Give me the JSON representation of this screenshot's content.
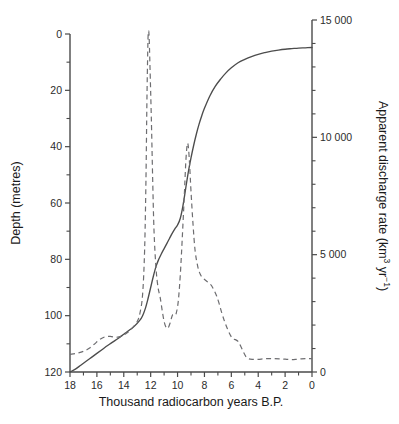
{
  "figure": {
    "name": "sea-level-and-meltwater-discharge-chart",
    "background": "#ffffff"
  },
  "chart_data": {
    "type": "line",
    "title": "",
    "subtitle": "",
    "xlabel": "Thousand radiocarbon years B.P.",
    "x_axis": {
      "min": 18,
      "max": 0,
      "reversed": true,
      "ticks": [
        18,
        16,
        14,
        12,
        10,
        8,
        6,
        4,
        2,
        0
      ],
      "tick_labels": [
        "18",
        "16",
        "14",
        "12",
        "10",
        "8",
        "6",
        "4",
        "2",
        "0"
      ],
      "minor_tick_step": 1
    },
    "y_axis_left": {
      "label": "Depth (metres)",
      "min": 0,
      "max": 120,
      "inverted": true,
      "ticks": [
        0,
        20,
        40,
        60,
        80,
        100,
        120
      ],
      "tick_labels": [
        "0",
        "20",
        "40",
        "60",
        "80",
        "100",
        "120"
      ],
      "minor_ticks": [
        10,
        30,
        50,
        70,
        90,
        110
      ]
    },
    "y_axis_right": {
      "label": "Apparent discharge rate (km3 yr-1)",
      "label_parts": {
        "main": "Apparent discharge rate (km",
        "sup1": "3",
        "mid": " yr",
        "sup2": "−1",
        "tail": ")"
      },
      "min": 0,
      "max": 15000,
      "ticks": [
        0,
        5000,
        10000,
        15000
      ],
      "tick_labels": [
        "0",
        "5 000",
        "10 000",
        "15 000"
      ]
    },
    "grid": false,
    "legend": null,
    "series": [
      {
        "name": "Depth (sea-level rise curve)",
        "style": "solid",
        "color": "#4c4c4c",
        "axis": "left",
        "units": "metres below present",
        "points": [
          [
            18.0,
            120.0
          ],
          [
            17.6,
            119.0
          ],
          [
            17.2,
            117.6
          ],
          [
            16.8,
            116.2
          ],
          [
            16.4,
            114.8
          ],
          [
            16.0,
            113.4
          ],
          [
            15.6,
            112.0
          ],
          [
            15.2,
            110.6
          ],
          [
            14.8,
            109.3
          ],
          [
            14.4,
            108.0
          ],
          [
            14.0,
            106.6
          ],
          [
            13.6,
            105.2
          ],
          [
            13.2,
            103.7
          ],
          [
            12.8,
            101.6
          ],
          [
            12.6,
            100.0
          ],
          [
            12.4,
            97.5
          ],
          [
            12.2,
            94.0
          ],
          [
            12.0,
            90.0
          ],
          [
            11.8,
            86.0
          ],
          [
            11.6,
            82.5
          ],
          [
            11.4,
            80.0
          ],
          [
            11.2,
            78.0
          ],
          [
            11.0,
            76.2
          ],
          [
            10.8,
            74.4
          ],
          [
            10.6,
            72.6
          ],
          [
            10.4,
            70.8
          ],
          [
            10.2,
            69.2
          ],
          [
            10.0,
            67.8
          ],
          [
            9.8,
            65.5
          ],
          [
            9.6,
            61.0
          ],
          [
            9.4,
            55.0
          ],
          [
            9.2,
            49.0
          ],
          [
            9.0,
            44.0
          ],
          [
            8.8,
            39.5
          ],
          [
            8.6,
            35.5
          ],
          [
            8.4,
            32.0
          ],
          [
            8.2,
            29.0
          ],
          [
            8.0,
            26.4
          ],
          [
            7.6,
            22.0
          ],
          [
            7.2,
            18.6
          ],
          [
            6.8,
            16.0
          ],
          [
            6.4,
            13.8
          ],
          [
            6.0,
            12.0
          ],
          [
            5.5,
            10.2
          ],
          [
            5.0,
            9.0
          ],
          [
            4.5,
            8.0
          ],
          [
            4.0,
            7.2
          ],
          [
            3.5,
            6.6
          ],
          [
            3.0,
            6.1
          ],
          [
            2.5,
            5.7
          ],
          [
            2.0,
            5.4
          ],
          [
            1.5,
            5.2
          ],
          [
            1.0,
            5.0
          ],
          [
            0.5,
            4.9
          ],
          [
            0.0,
            4.8
          ]
        ]
      },
      {
        "name": "Apparent discharge rate",
        "style": "dashed",
        "color": "#6d6d70",
        "axis": "right",
        "units": "km3 yr-1",
        "points": [
          [
            18.0,
            750
          ],
          [
            17.5,
            800
          ],
          [
            17.0,
            880
          ],
          [
            16.6,
            1000
          ],
          [
            16.2,
            1180
          ],
          [
            15.8,
            1380
          ],
          [
            15.4,
            1500
          ],
          [
            15.0,
            1520
          ],
          [
            14.6,
            1480
          ],
          [
            14.2,
            1520
          ],
          [
            13.8,
            1650
          ],
          [
            13.4,
            1850
          ],
          [
            13.0,
            2150
          ],
          [
            12.8,
            2500
          ],
          [
            12.6,
            3300
          ],
          [
            12.45,
            5200
          ],
          [
            12.35,
            8200
          ],
          [
            12.28,
            11500
          ],
          [
            12.22,
            13600
          ],
          [
            12.18,
            14450
          ],
          [
            12.12,
            14350
          ],
          [
            12.05,
            13000
          ],
          [
            11.95,
            10800
          ],
          [
            11.85,
            8200
          ],
          [
            11.75,
            6000
          ],
          [
            11.6,
            4400
          ],
          [
            11.45,
            3600
          ],
          [
            11.3,
            3200
          ],
          [
            11.15,
            2650
          ],
          [
            11.0,
            2150
          ],
          [
            10.85,
            1900
          ],
          [
            10.7,
            1880
          ],
          [
            10.55,
            2100
          ],
          [
            10.4,
            2400
          ],
          [
            10.3,
            2450
          ],
          [
            10.2,
            2420
          ],
          [
            10.1,
            2500
          ],
          [
            9.95,
            3000
          ],
          [
            9.8,
            4100
          ],
          [
            9.65,
            5700
          ],
          [
            9.5,
            7500
          ],
          [
            9.4,
            8800
          ],
          [
            9.32,
            9500
          ],
          [
            9.25,
            9750
          ],
          [
            9.18,
            9500
          ],
          [
            9.1,
            8800
          ],
          [
            9.0,
            7700
          ],
          [
            8.85,
            6300
          ],
          [
            8.7,
            5200
          ],
          [
            8.5,
            4500
          ],
          [
            8.3,
            4150
          ],
          [
            8.1,
            4000
          ],
          [
            7.9,
            3900
          ],
          [
            7.7,
            3800
          ],
          [
            7.5,
            3700
          ],
          [
            7.3,
            3500
          ],
          [
            7.1,
            3250
          ],
          [
            6.9,
            2900
          ],
          [
            6.7,
            2500
          ],
          [
            6.5,
            2150
          ],
          [
            6.3,
            1850
          ],
          [
            6.1,
            1600
          ],
          [
            5.9,
            1420
          ],
          [
            5.7,
            1380
          ],
          [
            5.5,
            1300
          ],
          [
            5.3,
            1100
          ],
          [
            5.1,
            850
          ],
          [
            4.9,
            640
          ],
          [
            4.7,
            560
          ],
          [
            4.4,
            540
          ],
          [
            4.0,
            540
          ],
          [
            3.6,
            560
          ],
          [
            3.2,
            570
          ],
          [
            2.8,
            570
          ],
          [
            2.4,
            560
          ],
          [
            2.0,
            545
          ],
          [
            1.6,
            530
          ],
          [
            1.2,
            540
          ],
          [
            0.8,
            560
          ],
          [
            0.4,
            570
          ],
          [
            0.0,
            570
          ]
        ]
      }
    ],
    "annotations": []
  }
}
